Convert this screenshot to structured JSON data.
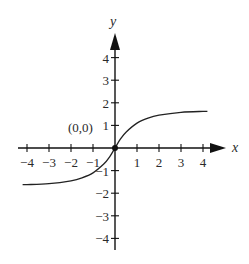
{
  "chart_data": {
    "type": "line",
    "title": "",
    "xlabel": "x",
    "ylabel": "y",
    "xlim": [
      -4.2,
      4.6
    ],
    "ylim": [
      -4.6,
      4.9
    ],
    "grid": false,
    "x_ticks": [
      -4,
      -3,
      -2,
      -1,
      1,
      2,
      3,
      4
    ],
    "y_ticks": [
      4,
      3,
      2,
      1,
      -1,
      -2,
      -3,
      -4
    ],
    "x_tick_labels": [
      "−4",
      "−3",
      "−2",
      "−1",
      "1",
      "2",
      "3",
      "4"
    ],
    "y_tick_labels": [
      "4",
      "3",
      "2",
      "1",
      "−1",
      "−2",
      "−3",
      "−4"
    ],
    "annotations": [
      {
        "text": "(0,0)",
        "x": 0,
        "y": 0,
        "marker": "filled-dot"
      }
    ],
    "series": [
      {
        "name": "curve",
        "x": [
          -4.2,
          -4,
          -3,
          -2,
          -1.5,
          -1,
          -0.5,
          -0.25,
          0,
          0.25,
          0.5,
          1,
          1.5,
          2,
          3,
          4,
          4.2
        ],
        "y": [
          -1.62,
          -1.62,
          -1.58,
          -1.45,
          -1.32,
          -1.1,
          -0.7,
          -0.4,
          0,
          0.4,
          0.7,
          1.1,
          1.32,
          1.45,
          1.58,
          1.62,
          1.62
        ]
      }
    ]
  },
  "labels": {
    "x_axis": "x",
    "y_axis": "y",
    "origin": "(0,0)"
  }
}
